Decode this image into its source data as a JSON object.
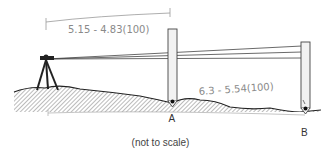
{
  "diagram": {
    "annotation_top": "5.15 - 4.83(100)",
    "annotation_bottom": "6.3 - 5.54(100)",
    "point_a_label": "A",
    "point_b_label": "B",
    "caption": "(not to scale)",
    "elements": [
      "level-instrument-tripod",
      "rod-A",
      "rod-B",
      "sight-lines",
      "ground-profile",
      "distance-dimension-top",
      "distance-dimension-bottom"
    ],
    "colors": {
      "ink": "#333333",
      "pencil": "#8a8a8a",
      "rod_fill": "#f2f2f2",
      "hatch": "#777777"
    }
  }
}
